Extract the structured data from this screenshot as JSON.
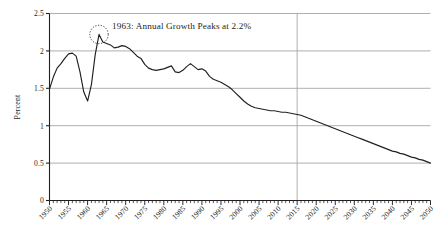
{
  "chart_data": {
    "type": "line",
    "title": "",
    "xlabel": "",
    "ylabel": "Percent",
    "xlim": [
      1950,
      2050
    ],
    "ylim": [
      0,
      2.5
    ],
    "ytick_values": [
      0,
      0.5,
      1,
      1.5,
      2,
      2.5
    ],
    "ytick_labels": [
      "0",
      "0.5",
      "1",
      "1.5",
      "2",
      "2.5"
    ],
    "xtick_values": [
      1950,
      1955,
      1960,
      1965,
      1970,
      1975,
      1980,
      1985,
      1990,
      1995,
      2000,
      2005,
      2010,
      2015,
      2020,
      2025,
      2030,
      2035,
      2040,
      2045,
      2050
    ],
    "xtick_labels": [
      "1950",
      "1955",
      "1960",
      "1965",
      "1970",
      "1975",
      "1980",
      "1985",
      "1990",
      "1995",
      "2000",
      "2005",
      "2010",
      "2015",
      "2020",
      "2025",
      "2030",
      "2035",
      "2040",
      "2045",
      "2050"
    ],
    "minor_xtick_interval": 1,
    "grid": "horizontal-gridlines-only",
    "legend": "none",
    "line_color": "#231f20",
    "grid_color": "#a6a6a6",
    "divider_color": "#a6a6a6",
    "divider_x": 2015,
    "annotations": [
      {
        "label": "1963: Annual Growth Peaks at 2.2%",
        "marker": "dotted-circle",
        "point_x": 1963,
        "point_y": 2.22
      }
    ],
    "x": [
      1950,
      1951,
      1952,
      1953,
      1954,
      1955,
      1956,
      1957,
      1958,
      1959,
      1960,
      1961,
      1962,
      1963,
      1964,
      1965,
      1966,
      1967,
      1968,
      1969,
      1970,
      1971,
      1972,
      1973,
      1974,
      1975,
      1976,
      1977,
      1978,
      1979,
      1980,
      1981,
      1982,
      1983,
      1984,
      1985,
      1986,
      1987,
      1988,
      1989,
      1990,
      1991,
      1992,
      1993,
      1994,
      1995,
      1996,
      1997,
      1998,
      1999,
      2000,
      2001,
      2002,
      2003,
      2004,
      2005,
      2006,
      2007,
      2008,
      2009,
      2010,
      2011,
      2012,
      2013,
      2014,
      2015,
      2016,
      2017,
      2018,
      2019,
      2020,
      2021,
      2022,
      2023,
      2024,
      2025,
      2026,
      2027,
      2028,
      2029,
      2030,
      2031,
      2032,
      2033,
      2034,
      2035,
      2036,
      2037,
      2038,
      2039,
      2040,
      2041,
      2042,
      2043,
      2044,
      2045,
      2046,
      2047,
      2048,
      2049,
      2050
    ],
    "values": [
      1.49,
      1.65,
      1.77,
      1.83,
      1.9,
      1.96,
      1.97,
      1.93,
      1.72,
      1.45,
      1.33,
      1.55,
      1.95,
      2.22,
      2.12,
      2.1,
      2.08,
      2.04,
      2.05,
      2.07,
      2.06,
      2.03,
      1.98,
      1.93,
      1.9,
      1.82,
      1.77,
      1.75,
      1.74,
      1.75,
      1.76,
      1.78,
      1.8,
      1.72,
      1.71,
      1.74,
      1.79,
      1.83,
      1.79,
      1.75,
      1.76,
      1.73,
      1.66,
      1.62,
      1.6,
      1.58,
      1.55,
      1.52,
      1.48,
      1.43,
      1.38,
      1.33,
      1.29,
      1.26,
      1.24,
      1.23,
      1.22,
      1.21,
      1.2,
      1.2,
      1.19,
      1.18,
      1.18,
      1.17,
      1.16,
      1.15,
      1.14,
      1.12,
      1.1,
      1.08,
      1.06,
      1.04,
      1.02,
      1.0,
      0.98,
      0.96,
      0.94,
      0.92,
      0.9,
      0.88,
      0.86,
      0.84,
      0.82,
      0.8,
      0.78,
      0.76,
      0.74,
      0.72,
      0.7,
      0.68,
      0.66,
      0.65,
      0.63,
      0.62,
      0.6,
      0.58,
      0.57,
      0.55,
      0.54,
      0.52,
      0.5
    ]
  }
}
